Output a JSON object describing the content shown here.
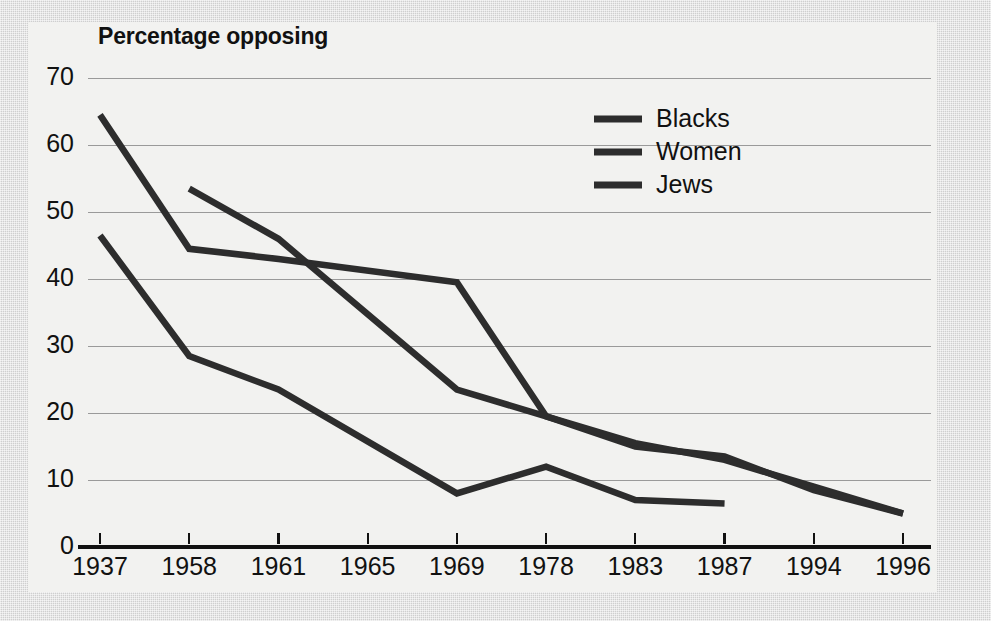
{
  "figure": {
    "background_color": "#cfcfcf",
    "panel_color": "#f2f2f0",
    "ink_color": "#2d2d2d",
    "grid_color": "#9a9a9a"
  },
  "chart_data": {
    "type": "line",
    "title": "Percentage opposing",
    "xlabel": "",
    "ylabel": "",
    "ylim": [
      0,
      70
    ],
    "yticks": [
      0,
      10,
      20,
      30,
      40,
      50,
      60,
      70
    ],
    "ytick_labels": [
      "0",
      "10",
      "20",
      "30",
      "40",
      "50",
      "60",
      "70"
    ],
    "grid": "horizontal",
    "legend_position": "upper-right-inside",
    "categories": [
      "1937",
      "1958",
      "1961",
      "1965",
      "1969",
      "1978",
      "1983",
      "1987",
      "1994",
      "1996"
    ],
    "series": [
      {
        "name": "Blacks",
        "color": "#2d2d2d",
        "x": [
          "1937",
          "1958",
          "1961",
          "1969",
          "1978",
          "1983",
          "1987",
          "1994",
          "1996"
        ],
        "values": [
          64.5,
          44.5,
          43,
          39.5,
          19.5,
          15,
          13.5,
          8.5,
          5
        ]
      },
      {
        "name": "Women",
        "color": "#2d2d2d",
        "x": [
          "1958",
          "1961",
          "1969",
          "1978",
          "1983",
          "1987",
          "1994",
          "1996"
        ],
        "values": [
          53.5,
          46,
          23.5,
          19.5,
          15.5,
          13,
          9,
          5
        ]
      },
      {
        "name": "Jews",
        "color": "#2d2d2d",
        "x": [
          "1937",
          "1958",
          "1961",
          "1969",
          "1978",
          "1983",
          "1987"
        ],
        "values": [
          46.5,
          28.5,
          23.5,
          8,
          12,
          7,
          6.5
        ]
      }
    ],
    "legend": [
      {
        "label": "Blacks"
      },
      {
        "label": "Women"
      },
      {
        "label": "Jews"
      }
    ]
  }
}
